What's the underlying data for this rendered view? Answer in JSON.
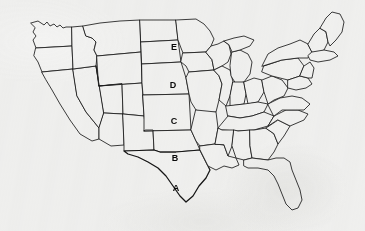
{
  "map": {
    "title": "United States State Outline Map",
    "subject": "Great Plains states identification quiz",
    "background_color": "#f3f3f2",
    "outline_color": "#1b1b1b",
    "border_color": "#141414",
    "fill_color": "#f4f4f3",
    "label_color": "#0a0a0a",
    "labels": [
      {
        "id": "label-e",
        "text": "E",
        "state": "South Dakota",
        "x": 174,
        "y": 47
      },
      {
        "id": "label-d",
        "text": "D",
        "state": "Nebraska",
        "x": 173,
        "y": 85
      },
      {
        "id": "label-c",
        "text": "C",
        "state": "Kansas",
        "x": 174,
        "y": 121
      },
      {
        "id": "label-b",
        "text": "B",
        "state": "Oklahoma",
        "x": 175,
        "y": 158
      },
      {
        "id": "label-a",
        "text": "A",
        "state": "Texas",
        "x": 176,
        "y": 188
      }
    ]
  }
}
